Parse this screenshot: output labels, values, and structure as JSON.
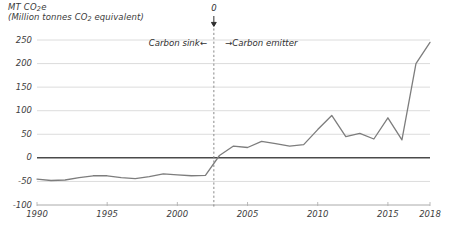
{
  "chart_data": {
    "type": "line",
    "title": "MT CO2e",
    "subtitle": "(Million tonnes CO2 equivalent)",
    "title_parts": {
      "main_prefix": "MT CO",
      "main_sub": "2",
      "main_suffix": "e",
      "sub_prefix": "(Million tonnes CO",
      "sub_sub": "2",
      "sub_suffix": " equivalent)"
    },
    "xlabel": "",
    "ylabel": "",
    "x": [
      1990,
      1991,
      1992,
      1993,
      1994,
      1995,
      1996,
      1997,
      1998,
      1999,
      2000,
      2001,
      2002,
      2003,
      2004,
      2005,
      2006,
      2007,
      2008,
      2009,
      2010,
      2011,
      2012,
      2013,
      2014,
      2015,
      2016,
      2017,
      2018
    ],
    "values": [
      -45,
      -48,
      -47,
      -42,
      -38,
      -38,
      -42,
      -44,
      -40,
      -34,
      -36,
      -38,
      -37,
      5,
      25,
      22,
      35,
      30,
      25,
      28,
      60,
      90,
      45,
      52,
      40,
      85,
      38,
      200,
      245
    ],
    "series": [
      {
        "name": "Net emissions",
        "color": "#7d7d7d",
        "values": [
          -45,
          -48,
          -47,
          -42,
          -38,
          -38,
          -42,
          -44,
          -40,
          -34,
          -36,
          -38,
          -37,
          5,
          25,
          22,
          35,
          30,
          25,
          28,
          60,
          90,
          45,
          52,
          40,
          85,
          38,
          200,
          245
        ]
      }
    ],
    "ylim": [
      -100,
      250
    ],
    "xlim": [
      1990,
      2018
    ],
    "yticks": [
      250,
      200,
      150,
      100,
      50,
      0,
      -50,
      -100
    ],
    "ytick_labels": [
      "250",
      "200",
      "150",
      "100",
      "50",
      "0",
      "-50",
      "-100"
    ],
    "xticks": [
      1990,
      1995,
      2000,
      2005,
      2010,
      2015,
      2018
    ],
    "xtick_labels": [
      "1990",
      "1995",
      "2000",
      "2005",
      "2010",
      "2015",
      "2018"
    ],
    "grid": true,
    "grid_color": "#d8d8d8",
    "zero_line_color": "#4a4a4a",
    "legend": "none",
    "annotations": [
      {
        "name": "crossover-marker",
        "label": "0",
        "x": 2002.6,
        "type": "vertical-dashed-line-with-down-arrow",
        "color": "#8a8a8a"
      },
      {
        "name": "carbon-sink",
        "label": "Carbon sink",
        "arrow": "←",
        "side": "left"
      },
      {
        "name": "carbon-emitter",
        "label": "Carbon emitter",
        "arrow": "→",
        "side": "right"
      }
    ]
  },
  "annotations": {
    "sink_label": "Carbon sink",
    "sink_arrow": "←",
    "emitter_label": "Carbon emitter",
    "emitter_arrow": "→",
    "zero_marker": "0"
  }
}
